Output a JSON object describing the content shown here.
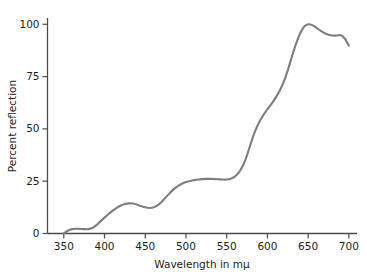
{
  "chart_data": {
    "type": "line",
    "title": "",
    "xlabel": "Wavelength in mμ",
    "ylabel": "Percent reflection",
    "xlim": [
      330,
      710
    ],
    "ylim": [
      0,
      103
    ],
    "xticks": [
      350,
      400,
      450,
      500,
      550,
      600,
      650,
      700
    ],
    "yticks": [
      0,
      25,
      50,
      75,
      100
    ],
    "xtick_labels": [
      "350",
      "400",
      "450",
      "500",
      "550",
      "600",
      "650",
      "700"
    ],
    "ytick_labels": [
      "0",
      "25",
      "50",
      "75",
      "100"
    ],
    "grid": false,
    "legend": "none",
    "series": [
      {
        "name": "Percent reflection",
        "color": "#7e7e7e",
        "x": [
          350,
          355,
          360,
          365,
          370,
          375,
          380,
          385,
          390,
          395,
          400,
          405,
          410,
          415,
          420,
          425,
          430,
          435,
          440,
          445,
          450,
          455,
          460,
          465,
          470,
          475,
          480,
          485,
          490,
          495,
          500,
          505,
          510,
          515,
          520,
          525,
          530,
          535,
          540,
          545,
          550,
          555,
          560,
          565,
          570,
          575,
          580,
          585,
          590,
          595,
          600,
          605,
          610,
          615,
          620,
          625,
          630,
          635,
          640,
          645,
          650,
          655,
          660,
          665,
          670,
          675,
          680,
          685,
          690,
          695,
          700
        ],
        "y": [
          0.0,
          1.3,
          2.1,
          2.3,
          2.2,
          2.1,
          2.1,
          2.6,
          4.0,
          5.8,
          7.6,
          9.3,
          10.9,
          12.3,
          13.4,
          14.1,
          14.4,
          14.3,
          13.8,
          13.1,
          12.5,
          12.2,
          12.4,
          13.4,
          15.1,
          17.2,
          19.3,
          21.2,
          22.7,
          23.8,
          24.6,
          25.1,
          25.5,
          25.8,
          26.0,
          26.1,
          26.1,
          26.0,
          25.9,
          25.8,
          25.8,
          26.2,
          27.2,
          29.2,
          32.5,
          37.5,
          43.5,
          49.0,
          53.3,
          56.6,
          59.4,
          62.0,
          64.8,
          68.2,
          72.5,
          78.0,
          84.5,
          90.5,
          95.5,
          98.8,
          100.0,
          99.6,
          98.4,
          97.0,
          95.8,
          95.0,
          94.6,
          94.6,
          94.8,
          93.2,
          89.8
        ]
      }
    ]
  },
  "axis": {
    "x_title": "Wavelength in mμ",
    "y_title": "Percent reflection"
  }
}
